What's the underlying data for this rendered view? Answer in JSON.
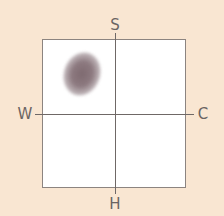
{
  "diagram": {
    "type": "quadrant-plot",
    "axis_labels": {
      "top": "S",
      "bottom": "H",
      "left": "W",
      "right": "C"
    },
    "marker": {
      "shape": "blurred-ellipse",
      "quadrant": "top-left",
      "color": "#7e6a70"
    },
    "colors": {
      "background": "#f9e6d2",
      "plot_area": "#ffffff",
      "axis": "#6f6866",
      "label": "#6a6462"
    }
  }
}
